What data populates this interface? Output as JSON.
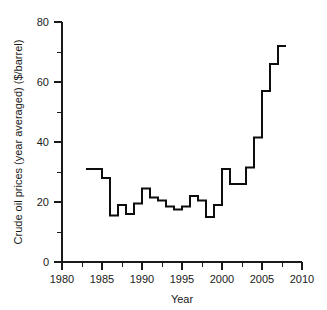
{
  "chart_data": {
    "type": "line",
    "subtype": "step-post",
    "title": "",
    "xlabel": "Year",
    "ylabel": "Crude oil prices (year averaged) ($/barrel)",
    "xlim": [
      1980,
      2010
    ],
    "ylim": [
      0,
      80
    ],
    "grid": false,
    "legend": null,
    "x_ticks_major": [
      1980,
      1985,
      1990,
      1995,
      2000,
      2005,
      2010
    ],
    "x_tick_labels": [
      "1980",
      "1985",
      "1990",
      "1995",
      "2000",
      "2005",
      "2010"
    ],
    "x_ticks_minor": [
      1982.5,
      1987.5,
      1992.5,
      1997.5,
      2002.5,
      2007.5
    ],
    "y_ticks_major": [
      0,
      20,
      40,
      60,
      80
    ],
    "y_tick_labels": [
      "0",
      "20",
      "40",
      "60",
      "80"
    ],
    "y_ticks_minor": [
      10,
      30,
      50,
      70
    ],
    "series": [
      {
        "name": "Crude oil price (year averaged)",
        "color": "#0d0d0d",
        "x": [
          1983,
          1984,
          1985,
          1986,
          1987,
          1988,
          1989,
          1990,
          1991,
          1992,
          1993,
          1994,
          1995,
          1996,
          1997,
          1998,
          1999,
          2000,
          2001,
          2002,
          2003,
          2004,
          2005,
          2006,
          2007
        ],
        "values": [
          31.0,
          31.0,
          28.0,
          15.5,
          19.0,
          16.0,
          19.5,
          24.5,
          21.5,
          20.5,
          18.5,
          17.5,
          18.5,
          22.0,
          20.5,
          15.0,
          19.0,
          31.0,
          26.0,
          26.0,
          31.5,
          41.5,
          57.0,
          66.0,
          72.0
        ]
      }
    ],
    "annotations": []
  },
  "axes": {
    "y_label": "Crude oil prices (year averaged) ($/barrel)",
    "x_label": "Year",
    "y_tick_labels": [
      "80",
      "60",
      "40",
      "20",
      "0"
    ],
    "x_tick_labels": [
      "1980",
      "1985",
      "1990",
      "1995",
      "2000",
      "2005",
      "2010"
    ]
  }
}
